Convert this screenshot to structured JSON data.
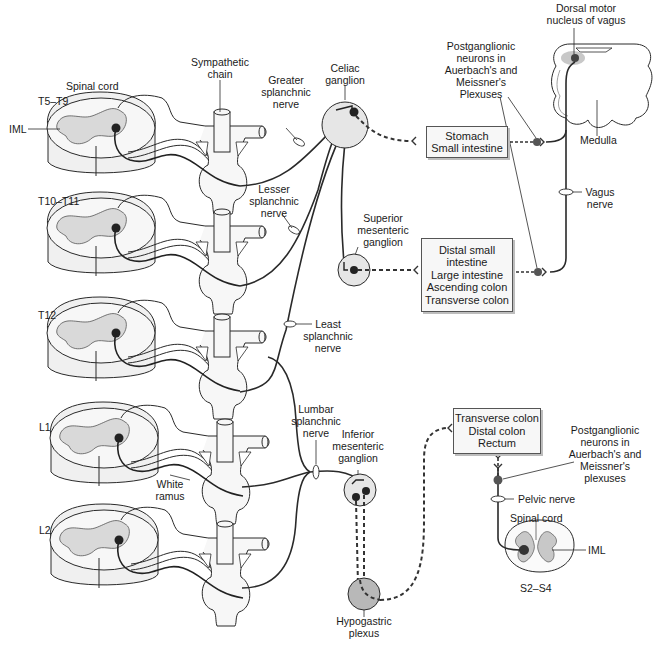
{
  "figure": {
    "colors": {
      "background": "#ffffff",
      "line": "#2a2a2a",
      "cord_fill": "#f2f2f2",
      "gray_matter": "#d9d9d9",
      "ganglion_fill": "#e6e6e6",
      "plexus_fill": "#b8b8b8",
      "neuron": "#222222",
      "nucleus_highlight": "#c8c8c8",
      "box_fill": "#f7f7f7"
    },
    "sympathetic": {
      "spinal_cord_label": "Spinal cord",
      "iml_label": "IML",
      "sympathetic_chain_label": "Sympathetic chain",
      "white_ramus_label": "White ramus",
      "segments": [
        {
          "id": "t5-t9",
          "label": "T5–T9"
        },
        {
          "id": "t10-t11",
          "label": "T10–T11"
        },
        {
          "id": "t12",
          "label": "T12"
        },
        {
          "id": "l1",
          "label": "L1"
        },
        {
          "id": "l2",
          "label": "L2"
        }
      ],
      "nerves": {
        "greater": "Greater splanchnic nerve",
        "lesser": "Lesser splanchnic nerve",
        "least": "Least splanchnic nerve",
        "lumbar": "Lumbar splanchnic nerve"
      },
      "ganglia": {
        "celiac": "Celiac ganglion",
        "superior_mesenteric": "Superior mesenteric ganglion",
        "inferior_mesenteric": "Inferior mesenteric ganglion",
        "hypogastric": "Hypogastric plexus"
      }
    },
    "targets": {
      "upper": [
        "Stomach",
        "Small intestine"
      ],
      "middle": [
        "Distal small",
        "intestine",
        "Large intestine",
        "Ascending colon",
        "Transverse colon"
      ],
      "lower": [
        "Transverse colon",
        "Distal colon",
        "Rectum"
      ]
    },
    "parasympathetic": {
      "dorsal_motor_nucleus": "Dorsal motor nucleus of vagus",
      "medulla": "Medulla",
      "vagus_nerve": "Vagus nerve",
      "postganglionic_upper": "Postganglionic neurons in Auerbach's and Meissner's Plexuses",
      "postganglionic_lower": "Postganglionic neurons in Auerbach's and Meissner's plexuses",
      "pelvic_nerve": "Pelvic nerve",
      "sacral_spinal_cord": "Spinal cord",
      "sacral_iml": "IML",
      "sacral_segments": "S2–S4"
    }
  },
  "labels": {
    "dorsal_motor_l1": "Dorsal motor",
    "dorsal_motor_l2": "nucleus of vagus",
    "pg_up_l1": "Postganglionic",
    "pg_up_l2": "neurons in",
    "pg_up_l3": "Auerbach's and",
    "pg_up_l4": "Meissner's",
    "pg_up_l5": "Plexuses",
    "pg_lo_l1": "Postganglionic",
    "pg_lo_l2": "neurons in",
    "pg_lo_l3": "Auerbach's and",
    "pg_lo_l4": "Meissner's",
    "pg_lo_l5": "plexuses",
    "sym_chain_l1": "Sympathetic",
    "sym_chain_l2": "chain",
    "greater_l1": "Greater",
    "greater_l2": "splanchnic",
    "greater_l3": "nerve",
    "lesser_l1": "Lesser",
    "lesser_l2": "splanchnic",
    "lesser_l3": "nerve",
    "least_l1": "Least",
    "least_l2": "splanchnic",
    "least_l3": "nerve",
    "lumbar_l1": "Lumbar",
    "lumbar_l2": "splanchnic",
    "lumbar_l3": "nerve",
    "celiac_l1": "Celiac",
    "celiac_l2": "ganglion",
    "sup_mes_l1": "Superior",
    "sup_mes_l2": "mesenteric",
    "sup_mes_l3": "ganglion",
    "inf_mes_l1": "Inferior",
    "inf_mes_l2": "mesenteric",
    "inf_mes_l3": "ganglion",
    "hypo_l1": "Hypogastric",
    "hypo_l2": "plexus",
    "vagus_l1": "Vagus",
    "vagus_l2": "nerve",
    "white_l1": "White",
    "white_l2": "ramus"
  }
}
